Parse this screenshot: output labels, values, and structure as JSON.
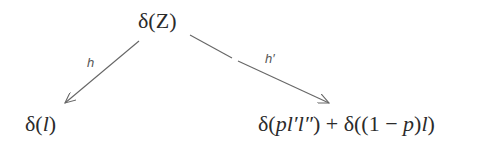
{
  "diagram": {
    "type": "tree",
    "nodes": {
      "root": {
        "id": "root",
        "parts": [
          "δ(",
          "Z",
          ")"
        ],
        "text": "δ(Z)"
      },
      "left": {
        "id": "left",
        "parts": [
          "δ(",
          "l",
          ")"
        ],
        "text": "δ(l)"
      },
      "right": {
        "id": "right",
        "parts": [
          "δ(",
          "pl′l″",
          ") + δ((1 − ",
          "p",
          ")",
          "l",
          ")"
        ],
        "text": "δ(pl′l″) + δ((1 − p)l)"
      }
    },
    "edges": [
      {
        "from": "root",
        "to": "left",
        "label": "h"
      },
      {
        "from": "root",
        "to": "right",
        "label": "h′"
      }
    ]
  },
  "colors": {
    "text": "#2b2b2b",
    "edge": "#666666",
    "background": "#ffffff"
  }
}
